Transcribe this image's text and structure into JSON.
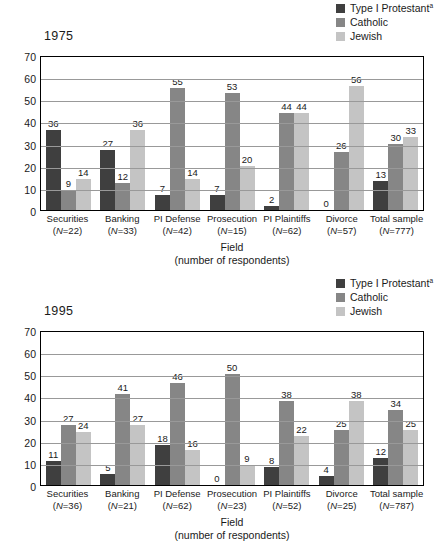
{
  "legend": {
    "items": [
      {
        "label": "Type I Protestant",
        "marker": "a",
        "color": "#3f3f3f",
        "swatch_name": "legend-swatch-protestant"
      },
      {
        "label": "Catholic",
        "marker": "",
        "color": "#868686",
        "swatch_name": "legend-swatch-catholic"
      },
      {
        "label": "Jewish",
        "marker": "",
        "color": "#c4c4c4",
        "swatch_name": "legend-swatch-jewish"
      }
    ]
  },
  "axis": {
    "xlabel_line1": "Field",
    "xlabel_line2": "(number of respondents)",
    "yticks": [
      "70",
      "60",
      "50",
      "40",
      "30",
      "20",
      "10",
      "0"
    ]
  },
  "panels": [
    {
      "year": "1975",
      "chart_index": 0
    },
    {
      "year": "1995",
      "chart_index": 1
    }
  ],
  "chart_data": [
    {
      "type": "bar",
      "title": "1975",
      "xlabel": "Field (number of respondents)",
      "ylabel": "",
      "ylim": [
        0,
        70
      ],
      "yticks": [
        0,
        10,
        20,
        30,
        40,
        50,
        60,
        70
      ],
      "grid": true,
      "legend_position": "top-right",
      "categories": [
        "Securities",
        "Banking",
        "PI Defense",
        "Prosecution",
        "PI Plaintiffs",
        "Divorce",
        "Total sample"
      ],
      "category_n": [
        "(N = 22)",
        "(N = 33)",
        "(N = 42)",
        "(N = 15)",
        "(N = 62)",
        "(N = 57)",
        "(N = 777)"
      ],
      "series": [
        {
          "name": "Type I Protestant",
          "color": "#3f3f3f",
          "values": [
            36,
            27,
            7,
            7,
            2,
            0,
            13
          ]
        },
        {
          "name": "Catholic",
          "color": "#868686",
          "values": [
            9,
            12,
            55,
            53,
            44,
            26,
            30
          ]
        },
        {
          "name": "Jewish",
          "color": "#c4c4c4",
          "values": [
            14,
            36,
            14,
            20,
            44,
            56,
            33
          ]
        }
      ]
    },
    {
      "type": "bar",
      "title": "1995",
      "xlabel": "Field (number of respondents)",
      "ylabel": "",
      "ylim": [
        0,
        70
      ],
      "yticks": [
        0,
        10,
        20,
        30,
        40,
        50,
        60,
        70
      ],
      "grid": true,
      "legend_position": "top-right",
      "categories": [
        "Securities",
        "Banking",
        "PI Defense",
        "Prosecution",
        "PI Plaintiffs",
        "Divorce",
        "Total sample"
      ],
      "category_n": [
        "(N = 36)",
        "(N = 21)",
        "(N = 62)",
        "(N = 23)",
        "(N = 52)",
        "(N = 25)",
        "(N = 787)"
      ],
      "series": [
        {
          "name": "Type I Protestant",
          "color": "#3f3f3f",
          "values": [
            11,
            5,
            18,
            0,
            8,
            4,
            12
          ]
        },
        {
          "name": "Catholic",
          "color": "#868686",
          "values": [
            27,
            41,
            46,
            50,
            38,
            25,
            34
          ]
        },
        {
          "name": "Jewish",
          "color": "#c4c4c4",
          "values": [
            24,
            27,
            16,
            9,
            22,
            38,
            25
          ]
        }
      ]
    }
  ]
}
